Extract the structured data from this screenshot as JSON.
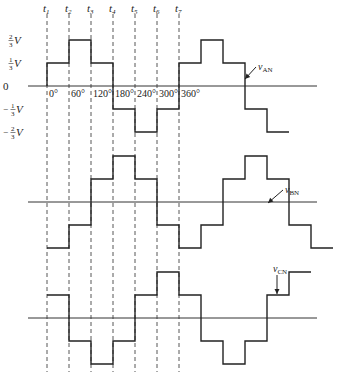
{
  "diagram": {
    "time_marks": [
      {
        "label": "t",
        "sub": "1",
        "x": 47
      },
      {
        "label": "t",
        "sub": "2",
        "x": 69
      },
      {
        "label": "t",
        "sub": "3",
        "x": 91
      },
      {
        "label": "t",
        "sub": "4",
        "x": 113
      },
      {
        "label": "t",
        "sub": "5",
        "x": 135
      },
      {
        "label": "t",
        "sub": "6",
        "x": 157
      },
      {
        "label": "t",
        "sub": "7",
        "x": 179
      }
    ],
    "angle_labels": [
      "0°",
      "60°",
      "120°",
      "180°",
      "240°",
      "300°",
      "360°"
    ],
    "y_labels": [
      {
        "text": "2/3 V",
        "num": "2",
        "den": "3",
        "sign": "",
        "level": 2
      },
      {
        "text": "1/3 V",
        "num": "1",
        "den": "3",
        "sign": "",
        "level": 1
      },
      {
        "text": "0",
        "level": 0
      },
      {
        "text": "-1/3 V",
        "num": "1",
        "den": "3",
        "sign": "−",
        "level": -1
      },
      {
        "text": "-2/3 V",
        "num": "2",
        "den": "3",
        "sign": "−",
        "level": -2
      }
    ],
    "step_width_px": 22,
    "level_px": 23,
    "x_start": 47,
    "axis_x_start": 28,
    "axis_x_end": 317,
    "waveforms": [
      {
        "name": "v_AN",
        "label_main": "v",
        "label_sub": "AN",
        "zero_y": 86,
        "levels": [
          1,
          2,
          1,
          -1,
          -2,
          -1,
          1,
          2,
          1,
          -1,
          -2
        ],
        "label_pos": [
          258,
          70
        ],
        "arrow_to": [
          245,
          79
        ]
      },
      {
        "name": "v_BN",
        "label_main": "v",
        "label_sub": "BN",
        "zero_y": 202,
        "levels": [
          -2,
          -1,
          1,
          2,
          1,
          -1,
          -2,
          -1,
          1,
          2,
          1,
          -1,
          -2
        ],
        "label_pos": [
          285,
          193
        ],
        "arrow_to": [
          268,
          203
        ]
      },
      {
        "name": "v_CN",
        "label_main": "v",
        "label_sub": "CN",
        "zero_y": 318,
        "levels": [
          1,
          -1,
          -2,
          -1,
          1,
          2,
          1,
          -1,
          -2,
          -1,
          1,
          2
        ],
        "label_pos": [
          273,
          272
        ],
        "arrow_to": [
          277,
          294
        ]
      }
    ],
    "colors": {
      "ink": "#222222",
      "background": "#ffffff"
    }
  }
}
